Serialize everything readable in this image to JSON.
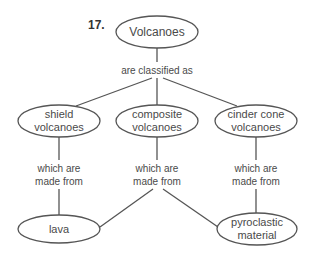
{
  "number": "17.",
  "nodes": {
    "root": {
      "lines": [
        "Volcanoes"
      ]
    },
    "shield": {
      "lines": [
        "shield",
        "volcanoes"
      ]
    },
    "composite": {
      "lines": [
        "composite",
        "volcanoes"
      ]
    },
    "cinder": {
      "lines": [
        "cinder cone",
        "volcanoes"
      ]
    },
    "lava": {
      "lines": [
        "lava"
      ]
    },
    "pyroclastic": {
      "lines": [
        "pyroclastic",
        "material"
      ]
    }
  },
  "links": {
    "classified": "are classified as",
    "made_from": [
      "which are",
      "made from"
    ]
  },
  "colors": {
    "stroke": "#555555",
    "text": "#4a4a4a"
  }
}
